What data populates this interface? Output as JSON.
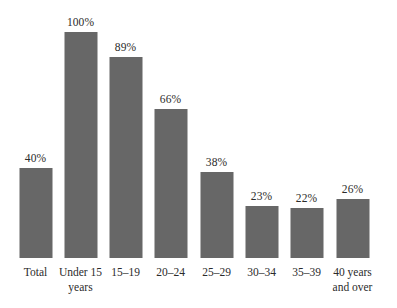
{
  "chart_data": {
    "type": "bar",
    "title": "",
    "subtitle": "",
    "xlabel": "",
    "ylabel": "",
    "ylim": [
      0,
      100
    ],
    "grid": false,
    "legend": false,
    "value_suffix": "%",
    "categories": [
      "Total",
      "Under 15 years",
      "15–19",
      "20–24",
      "25–29",
      "30–34",
      "35–39",
      "40 years and over"
    ],
    "category_lines": [
      [
        "Total"
      ],
      [
        "Under 15",
        "years"
      ],
      [
        "15–19"
      ],
      [
        "20–24"
      ],
      [
        "25–29"
      ],
      [
        "30–34"
      ],
      [
        "35–39"
      ],
      [
        "40 years",
        "and over"
      ]
    ],
    "values": [
      40,
      100,
      89,
      66,
      38,
      23,
      22,
      26
    ],
    "value_labels": [
      "40%",
      "100%",
      "89%",
      "66%",
      "38%",
      "23%",
      "22%",
      "26%"
    ],
    "bar_color": "#676767",
    "background_color": "#ffffff",
    "text_color": "#2b2b2b"
  }
}
